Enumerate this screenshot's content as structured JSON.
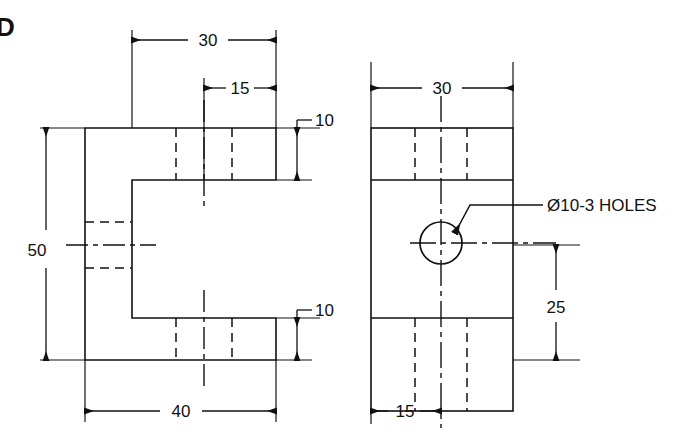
{
  "sheet": {
    "width": 676,
    "height": 438,
    "background": "#ffffff",
    "line_color": "#111111",
    "corner_mark": "D"
  },
  "views": [
    {
      "name": "side-view",
      "position": "left",
      "description": "C-shaped / U-channel side profile with upper and lower flanges"
    },
    {
      "name": "front-view",
      "position": "right",
      "description": "Rectangular front face with central through hole"
    }
  ],
  "dimensions": {
    "side_top_width": "30",
    "side_top_inner": "15",
    "side_upper_flange_thickness": "10",
    "side_lower_flange_thickness": "10",
    "side_overall_height": "50",
    "side_overall_width": "40",
    "front_width": "30",
    "front_hole_height": "25",
    "front_hole_offset": "15"
  },
  "notes": {
    "hole_callout": "Ø10-3 HOLES"
  },
  "geometry": {
    "side_view": {
      "left": 85,
      "right": 276,
      "top": 128,
      "bottom": 360,
      "web_right": 132,
      "flange_top_bottom": 180,
      "flange_bottom_top": 318,
      "notch_left": 132
    },
    "front_view": {
      "left": 371,
      "right": 513,
      "top": 128,
      "bottom": 411,
      "upper_band_bottom": 180,
      "lower_band_top": 318,
      "hole_cx": 441,
      "hole_cy": 243,
      "hole_r": 21
    }
  }
}
